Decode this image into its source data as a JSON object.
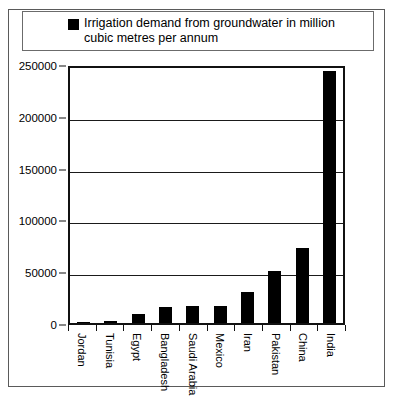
{
  "figure": {
    "cut_off_heading": "",
    "legend": {
      "marker": "black-square",
      "label_line1": "Irrigation demand from groundwater in",
      "label_line2": "million cubic metres per annum",
      "label_full": "Irrigation demand from groundwater in million cubic metres per annum"
    },
    "colors": {
      "bar": "#000000",
      "axis": "#111111",
      "grid": "#1a1a1a",
      "frame": "#5a5a5a",
      "background": "#ffffff"
    }
  },
  "chart_data": {
    "type": "bar",
    "title": "",
    "xlabel": "",
    "ylabel": "",
    "ylim": [
      0,
      250000
    ],
    "yticks": [
      0,
      50000,
      100000,
      150000,
      200000,
      250000
    ],
    "ytick_labels": [
      "0",
      "50000",
      "100000",
      "150000",
      "200000",
      "250000"
    ],
    "grid": true,
    "legend_position": "top",
    "orientation": "vertical",
    "categories": [
      "Jordan",
      "Tunisia",
      "Egypt",
      "Bangladesh",
      "Saudi Arabia",
      "Mexico",
      "Iran",
      "Pakistan",
      "China",
      "India"
    ],
    "series": [
      {
        "name": "Irrigation demand from groundwater in million cubic metres per annum",
        "color": "#000000",
        "values": [
          1000,
          1500,
          9000,
          15000,
          16000,
          16500,
          30000,
          50000,
          72000,
          243000
        ]
      }
    ]
  }
}
